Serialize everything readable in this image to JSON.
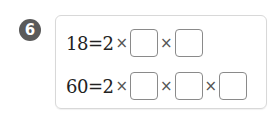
{
  "problem": {
    "number": "6",
    "rows": [
      {
        "lhs": "18",
        "equals": "=",
        "first_factor": "2",
        "operator": "×",
        "blank_count": 2
      },
      {
        "lhs": "60",
        "equals": "=",
        "first_factor": "2",
        "operator": "×",
        "blank_count": 3
      }
    ],
    "blanks": {
      "row1": [
        "",
        ""
      ],
      "row2": [
        "",
        "",
        ""
      ]
    }
  },
  "colors": {
    "badge": "#5a5a5a",
    "panel_border": "#d8d8d8",
    "blank_border": "#8a8a8a"
  }
}
